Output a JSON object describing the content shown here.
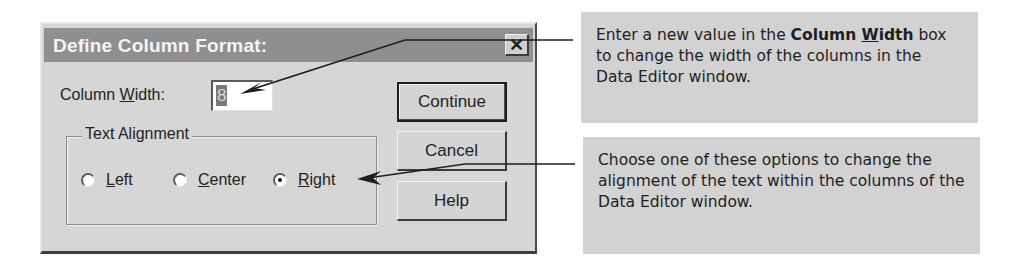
{
  "dialog": {
    "title": "Define Column Format:",
    "close_icon": "close-x-icon",
    "column_width": {
      "label_prefix": "Column ",
      "label_accel": "W",
      "label_suffix": "idth:",
      "value": "8"
    },
    "text_alignment": {
      "legend": "Text Alignment",
      "options": [
        {
          "accel": "L",
          "rest": "eft",
          "label": "Left",
          "checked": false
        },
        {
          "accel": "C",
          "rest": "enter",
          "label": "Center",
          "checked": false
        },
        {
          "accel": "R",
          "rest": "ight",
          "label": "Right",
          "checked": true
        }
      ],
      "selected": "Right"
    },
    "buttons": {
      "continue": "Continue",
      "cancel": "Cancel",
      "help": "Help"
    }
  },
  "callouts": [
    {
      "pre": "Enter a new value in the ",
      "bold_prefix": "Column ",
      "bold_accel": "W",
      "bold_suffix": "idth",
      "post": " box to change the width of the columns in the Data Editor window."
    },
    {
      "text": "Choose one of these options to change the alignment of the text within the columns of the Data Editor window."
    }
  ],
  "colors": {
    "dialog_bg": "#d6d6d6",
    "titlebar_bg": "#8f8f8f",
    "callout_bg": "#d2d2d2",
    "leader_line": "#1e1e1e"
  }
}
